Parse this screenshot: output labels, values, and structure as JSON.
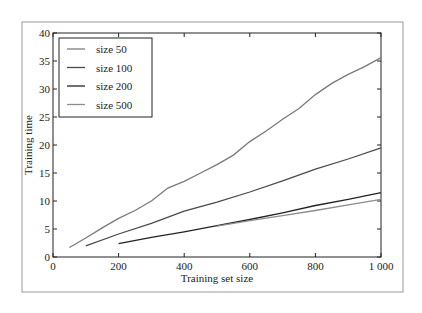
{
  "chart_data": {
    "type": "line",
    "title": "",
    "xlabel": "Training set size",
    "ylabel": "Training time",
    "xlim": [
      0,
      1000
    ],
    "ylim": [
      0,
      40
    ],
    "xticks": [
      0,
      200,
      400,
      600,
      800,
      1000
    ],
    "xtick_labels": [
      "0",
      "200",
      "400",
      "600",
      "800",
      "1 000"
    ],
    "yticks": [
      0,
      5,
      10,
      15,
      20,
      25,
      30,
      35,
      40
    ],
    "ytick_labels": [
      "0",
      "5",
      "10",
      "15",
      "20",
      "25",
      "30",
      "35",
      "40"
    ],
    "grid": false,
    "legend_position": "upper left",
    "series": [
      {
        "name": "size 50",
        "color": "#7a7a7a",
        "x": [
          50,
          100,
          150,
          200,
          250,
          300,
          350,
          400,
          450,
          500,
          550,
          600,
          650,
          700,
          750,
          800,
          850,
          900,
          950,
          1000
        ],
        "values": [
          1.7,
          3.4,
          5.2,
          6.9,
          8.3,
          10.0,
          12.3,
          13.5,
          15.0,
          16.5,
          18.2,
          20.6,
          22.5,
          24.6,
          26.5,
          29.0,
          31.0,
          32.6,
          34.0,
          35.6
        ]
      },
      {
        "name": "size 100",
        "color": "#4a4a4a",
        "x": [
          100,
          200,
          300,
          400,
          500,
          600,
          700,
          800,
          900,
          1000
        ],
        "values": [
          2.0,
          4.1,
          6.0,
          8.2,
          9.8,
          11.6,
          13.6,
          15.7,
          17.5,
          19.5
        ]
      },
      {
        "name": "size 200",
        "color": "#222222",
        "x": [
          200,
          300,
          400,
          500,
          600,
          700,
          800,
          900,
          1000
        ],
        "values": [
          2.4,
          3.5,
          4.5,
          5.6,
          6.7,
          7.9,
          9.2,
          10.3,
          11.5
        ]
      },
      {
        "name": "size 500",
        "color": "#8c8c8c",
        "x": [
          500,
          600,
          700,
          800,
          900,
          1000
        ],
        "values": [
          5.5,
          6.5,
          7.4,
          8.3,
          9.3,
          10.3
        ]
      }
    ]
  }
}
